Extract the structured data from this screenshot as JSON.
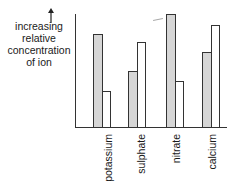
{
  "chart_data": {
    "type": "bar",
    "title": "",
    "xlabel": "",
    "ylabel": "increasing relative concentration of ion",
    "ylabel_lines": [
      "increasing",
      "relative",
      "concentration",
      "of ion"
    ],
    "y_arrow": "↑",
    "categories": [
      "potassium",
      "sulphate",
      "nitrate",
      "calcium"
    ],
    "series": [
      {
        "name": "shaded",
        "pattern": "stippled",
        "values": [
          93,
          56,
          113,
          75
        ]
      },
      {
        "name": "unshaded",
        "pattern": "white",
        "values": [
          36,
          85,
          46,
          102
        ]
      }
    ],
    "ylim": [
      0,
      113
    ],
    "y_ticks": "none",
    "grid": false,
    "legend": "none",
    "units": "relative (pixel-height estimate)"
  },
  "colors": {
    "axis": "#333333",
    "shaded_fill": "#d6d6d6",
    "stipple": "#8a8a8a",
    "unshaded_fill": "#ffffff"
  }
}
